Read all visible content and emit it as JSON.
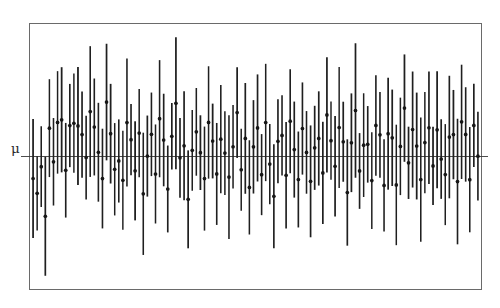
{
  "figure": {
    "title": "",
    "subtitle": "",
    "mu_label": "μ",
    "background_color": "#ffffff",
    "frame_color": "#6a6a6a",
    "interval_color": "#1f1f1f",
    "point_color": "#161616",
    "reference_line_color": "#3a3a3a"
  },
  "chart_data": {
    "type": "line",
    "chart_subtype": "confidence-interval-plot",
    "title": "",
    "xlabel": "",
    "ylabel": "",
    "legend": [],
    "grid": false,
    "annotations": [
      {
        "text": "μ",
        "x": 0,
        "y": 0,
        "position": "left-axis",
        "description": "Population mean reference line label"
      }
    ],
    "reference_line": {
      "orientation": "horizontal",
      "y": 0,
      "label": "μ"
    },
    "axis_frame": {
      "left": 29,
      "top": 23,
      "right": 482,
      "bottom": 290
    },
    "xlim": [
      0,
      111
    ],
    "ylim": [
      -3.1,
      3.1
    ],
    "n_intervals": 110,
    "marker": "filled-circle",
    "series": [
      {
        "name": "confidence intervals",
        "x": [
          1,
          2,
          3,
          4,
          5,
          6,
          7,
          8,
          9,
          10,
          11,
          12,
          13,
          14,
          15,
          16,
          17,
          18,
          19,
          20,
          21,
          22,
          23,
          24,
          25,
          26,
          27,
          28,
          29,
          30,
          31,
          32,
          33,
          34,
          35,
          36,
          37,
          38,
          39,
          40,
          41,
          42,
          43,
          44,
          45,
          46,
          47,
          48,
          49,
          50,
          51,
          52,
          53,
          54,
          55,
          56,
          57,
          58,
          59,
          60,
          61,
          62,
          63,
          64,
          65,
          66,
          67,
          68,
          69,
          70,
          71,
          72,
          73,
          74,
          75,
          76,
          77,
          78,
          79,
          80,
          81,
          82,
          83,
          84,
          85,
          86,
          87,
          88,
          89,
          90,
          91,
          92,
          93,
          94,
          95,
          96,
          97,
          98,
          99,
          100,
          101,
          102,
          103,
          104,
          105,
          106,
          107,
          108,
          109,
          110
        ],
        "center": [
          -0.62,
          -1.08,
          -0.35,
          -1.42,
          0.52,
          0.15,
          0.72,
          0.94,
          -0.18,
          0.6,
          1.02,
          0.88,
          0.35,
          -0.08,
          1.1,
          0.46,
          0.25,
          -0.55,
          1.25,
          0.7,
          -0.3,
          0.08,
          -0.72,
          0.95,
          0.4,
          -0.15,
          0.62,
          -0.92,
          0.18,
          0.55,
          -0.42,
          0.85,
          0.22,
          -0.6,
          0.34,
          1.05,
          -0.25,
          0.48,
          -0.88,
          0.15,
          0.7,
          0.05,
          -0.5,
          0.92,
          0.28,
          -0.35,
          0.6,
          0.18,
          -0.7,
          0.42,
          0.88,
          -0.12,
          0.55,
          -0.45,
          0.3,
          0.75,
          -0.22,
          0.95,
          0.08,
          -0.65,
          0.5,
          0.35,
          -0.38,
          0.82,
          0.2,
          -0.55,
          0.68,
          0.12,
          -0.8,
          0.45,
          0.58,
          -0.18,
          0.9,
          0.25,
          -0.48,
          0.72,
          0.15,
          -0.62,
          0.38,
          0.85,
          -0.28,
          0.52,
          0.05,
          -0.72,
          0.65,
          0.3,
          -0.4,
          0.78,
          0.18,
          -0.55,
          0.48,
          0.92,
          -0.15,
          0.6,
          0.22,
          -0.68,
          0.42,
          0.75,
          -0.32,
          0.55,
          0.1,
          -0.58,
          0.68,
          0.35,
          -0.45,
          0.8,
          0.25,
          -0.62,
          0.5,
          0.15
        ],
        "half_width": [
          1.25,
          1.05,
          0.95,
          1.35,
          1.15,
          0.88,
          1.2,
          1.4,
          0.98,
          1.1,
          1.3,
          1.18,
          0.92,
          1.05,
          1.45,
          1.02,
          0.95,
          1.22,
          1.38,
          1.08,
          0.9,
          1.15,
          1.28,
          1.35,
          0.98,
          1.05,
          1.18,
          1.42,
          0.95,
          1.12,
          1.25,
          1.3,
          1.0,
          1.2,
          0.92,
          1.38,
          1.08,
          1.15,
          1.32,
          0.98,
          1.22,
          1.05,
          1.18,
          1.4,
          0.95,
          1.1,
          1.28,
          1.02,
          1.35,
          1.15,
          1.25,
          0.98,
          1.08,
          1.2,
          0.92,
          1.3,
          1.12,
          1.38,
          1.0,
          1.25,
          1.18,
          1.05,
          1.15,
          1.32,
          0.95,
          1.22,
          1.28,
          1.02,
          1.4,
          1.1,
          1.18,
          1.08,
          1.35,
          0.98,
          1.2,
          1.25,
          1.05,
          1.3,
          1.12,
          1.38,
          1.0,
          1.15,
          0.92,
          1.28,
          1.22,
          1.08,
          1.18,
          1.32,
          1.02,
          1.25,
          1.1,
          1.4,
          0.95,
          1.2,
          1.05,
          1.3,
          1.15,
          1.35,
          1.08,
          1.22,
          0.98,
          1.18,
          1.28,
          1.12,
          1.25,
          1.38,
          1.02,
          1.3,
          1.15,
          1.2
        ]
      }
    ]
  }
}
